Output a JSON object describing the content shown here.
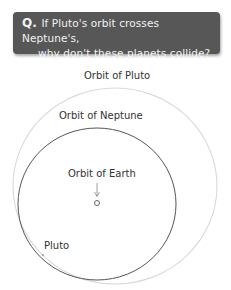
{
  "question": {
    "icon": "Q.",
    "line1": "If Pluto's orbit crosses Neptune's,",
    "line2": "why don't these planets collide?"
  },
  "diagram": {
    "labels": {
      "pluto_orbit": "Orbit of Pluto",
      "neptune_orbit": "Orbit of Neptune",
      "earth_orbit": "Orbit of Earth",
      "pluto": "Pluto"
    },
    "colors": {
      "question_bg": "#575757",
      "neptune_orbit": "#555555",
      "pluto_orbit": "#d8d8d8"
    }
  }
}
